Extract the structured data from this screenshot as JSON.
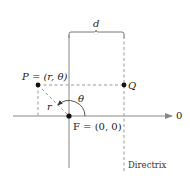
{
  "diagram": {
    "labels": {
      "distance": "d",
      "point_p": "P = (r, θ)",
      "point_q": "Q",
      "angle": "θ",
      "radius": "r",
      "focus": "F = (0, 0)",
      "polar_axis": "0",
      "directrix": "Directrix"
    },
    "colors": {
      "line": "#888888",
      "dashed": "#999999",
      "point": "#111111",
      "text": "#222222"
    }
  }
}
